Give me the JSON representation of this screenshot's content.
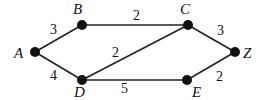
{
  "graph": {
    "nodes": [
      {
        "id": "A",
        "label": "A",
        "x": 35,
        "y": 52,
        "lx": 14,
        "ly": 58
      },
      {
        "id": "B",
        "label": "B",
        "x": 82,
        "y": 25,
        "lx": 73,
        "ly": 14
      },
      {
        "id": "C",
        "label": "C",
        "x": 188,
        "y": 25,
        "lx": 180,
        "ly": 14
      },
      {
        "id": "Z",
        "label": "Z",
        "x": 235,
        "y": 52,
        "lx": 243,
        "ly": 58
      },
      {
        "id": "D",
        "label": "D",
        "x": 82,
        "y": 80,
        "lx": 74,
        "ly": 97
      },
      {
        "id": "E",
        "label": "E",
        "x": 187,
        "y": 80,
        "lx": 192,
        "ly": 97
      }
    ],
    "edges": [
      {
        "from": "A",
        "to": "B",
        "weight": "3",
        "wx": 50,
        "wy": 34
      },
      {
        "from": "A",
        "to": "D",
        "weight": "4",
        "wx": 50,
        "wy": 80
      },
      {
        "from": "B",
        "to": "C",
        "weight": "2",
        "wx": 133,
        "wy": 20
      },
      {
        "from": "D",
        "to": "C",
        "weight": "2",
        "wx": 112,
        "wy": 57
      },
      {
        "from": "D",
        "to": "E",
        "weight": "5",
        "wx": 121,
        "wy": 93
      },
      {
        "from": "C",
        "to": "Z",
        "weight": "3",
        "wx": 217,
        "wy": 35
      },
      {
        "from": "E",
        "to": "Z",
        "weight": "2",
        "wx": 216,
        "wy": 81
      }
    ]
  }
}
